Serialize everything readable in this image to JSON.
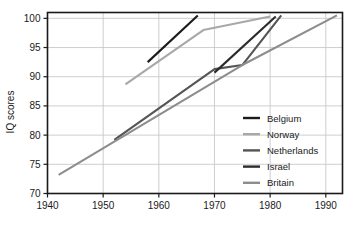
{
  "chart_data": {
    "type": "line",
    "title": "",
    "xlabel": "",
    "ylabel": "IQ scores",
    "xlim": [
      1940,
      1993
    ],
    "ylim": [
      70,
      101
    ],
    "grid": true,
    "legend_position": "right-inside-lower",
    "xticks": [
      1940,
      1950,
      1960,
      1970,
      1980,
      1990
    ],
    "xtick_labels": [
      "1940",
      "1950",
      "1960",
      "1970",
      "1980",
      "1990"
    ],
    "yticks": [
      70,
      75,
      80,
      85,
      90,
      95,
      100
    ],
    "ytick_labels": [
      "70",
      "75",
      "80",
      "85",
      "90",
      "95",
      "100"
    ],
    "series": [
      {
        "name": "Belgium",
        "color": "#1b1b1b",
        "points": [
          [
            1958,
            92.5
          ],
          [
            1967,
            100.5
          ]
        ]
      },
      {
        "name": "Norway",
        "color": "#a8a8a8",
        "points": [
          [
            1954,
            88.7
          ],
          [
            1968,
            98.0
          ],
          [
            1980,
            100.3
          ]
        ]
      },
      {
        "name": "Netherlands",
        "color": "#555555",
        "points": [
          [
            1952,
            79.2
          ],
          [
            1970,
            91.3
          ],
          [
            1975,
            92.0
          ],
          [
            1982,
            100.5
          ]
        ]
      },
      {
        "name": "Israel",
        "color": "#2b2b2b",
        "points": [
          [
            1970,
            90.7
          ],
          [
            1981,
            100.3
          ]
        ]
      },
      {
        "name": "Britain",
        "color": "#8d8d8d",
        "points": [
          [
            1942,
            73.2
          ],
          [
            1975,
            92.0
          ],
          [
            1992,
            100.5
          ]
        ]
      }
    ]
  },
  "axes": {
    "y_title": "IQ scores"
  },
  "legend": {
    "entries": [
      {
        "label": "Belgium",
        "color": "#1b1b1b"
      },
      {
        "label": "Norway",
        "color": "#a8a8a8"
      },
      {
        "label": "Netherlands",
        "color": "#555555"
      },
      {
        "label": "Israel",
        "color": "#2b2b2b"
      },
      {
        "label": "Britain",
        "color": "#8d8d8d"
      }
    ]
  },
  "style": {
    "background": "#ffffff",
    "axis_color": "#1a1a1a",
    "grid_color": "#c8c8c8"
  }
}
